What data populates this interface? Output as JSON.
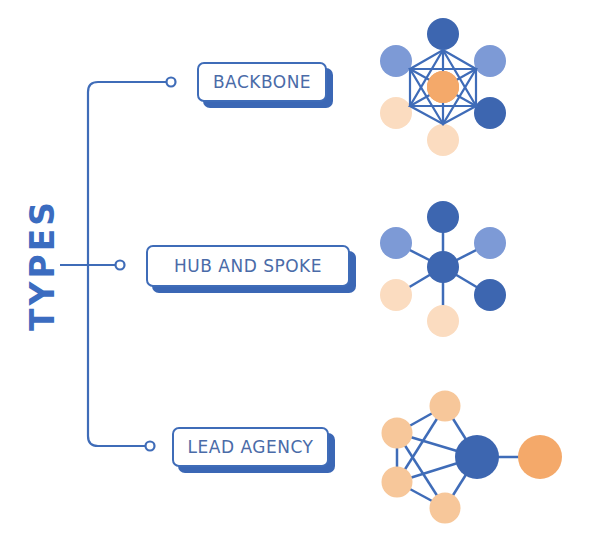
{
  "title": "TYPES",
  "colors": {
    "line": "#3f6cb8",
    "title": "#3b6cc0",
    "label_text": "#4a6ba8",
    "label_shadow": "#3b67b5",
    "node_dark_blue": "#3d66b0",
    "node_mid_blue": "#5b82c8",
    "node_light_blue": "#7d9ad6",
    "node_orange": "#f4a96a",
    "node_light_orange": "#f7c79a",
    "node_pale_orange": "#fbdcc0"
  },
  "types": [
    {
      "label": "BACKBONE",
      "diagram": "backbone"
    },
    {
      "label": "HUB AND SPOKE",
      "diagram": "hub-and-spoke"
    },
    {
      "label": "LEAD AGENCY",
      "diagram": "lead-agency"
    }
  ]
}
